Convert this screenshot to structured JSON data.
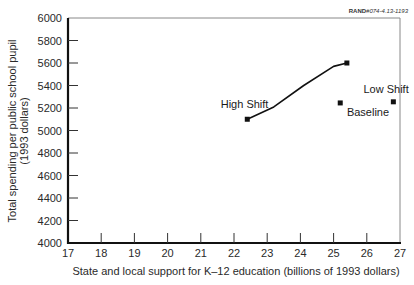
{
  "figure_code": {
    "prefix": "RAND",
    "suffix": "#074-4.13-1193"
  },
  "chart_data": {
    "type": "line",
    "title": "",
    "xlabel": "State and local support for K–12 education (billions of 1993 dollars)",
    "ylabel": "Total spending per public school pupil",
    "ylabel_line2": "(1993 dollars)",
    "xlim": [
      17,
      27
    ],
    "ylim": [
      4000,
      6000
    ],
    "x_ticks": [
      17,
      18,
      19,
      20,
      21,
      22,
      23,
      24,
      25,
      26,
      27
    ],
    "y_ticks": [
      4000,
      4200,
      4400,
      4600,
      4800,
      5000,
      5200,
      5400,
      5600,
      5800,
      6000
    ],
    "grid": false,
    "legend": "none (direct annotations)",
    "series": [
      {
        "name": "High Shift",
        "style": "line",
        "points": [
          {
            "x": 22.4,
            "y": 5100
          },
          {
            "x": 23.2,
            "y": 5210
          },
          {
            "x": 24.1,
            "y": 5400
          },
          {
            "x": 25.0,
            "y": 5570
          },
          {
            "x": 25.4,
            "y": 5600
          }
        ],
        "markers_at_ends": true
      },
      {
        "name": "Baseline",
        "style": "point",
        "points": [
          {
            "x": 25.2,
            "y": 5245
          }
        ]
      },
      {
        "name": "Low Shift",
        "style": "point",
        "points": [
          {
            "x": 26.8,
            "y": 5255
          }
        ]
      }
    ],
    "annotations": [
      {
        "text": "High Shift",
        "x": 21.6,
        "y": 5200
      },
      {
        "text": "Baseline",
        "x": 25.4,
        "y": 5130
      },
      {
        "text": "Low Shift",
        "x": 25.9,
        "y": 5330
      }
    ]
  }
}
